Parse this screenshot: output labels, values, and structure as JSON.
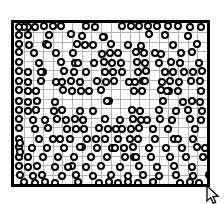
{
  "figure": {
    "title": "",
    "canvas": {
      "width": 224,
      "height": 204,
      "background": "#ffffff"
    },
    "frame": {
      "name": "plot-border",
      "x": 11,
      "y": 20,
      "width": 199,
      "height": 167,
      "border_width": 3,
      "border_color": "#000000",
      "fill": "#ffffff"
    },
    "grid": {
      "visible": true,
      "color": "#b4b4b4",
      "line_width": 1,
      "columns": 20,
      "rows": 17,
      "cell_width": 9.95,
      "cell_height": 9.82
    },
    "marker": {
      "shape": "ring",
      "diameter": 8,
      "ring_color": "#000000",
      "ring_width": 2.5,
      "fill_color": "#ffffff"
    },
    "cursor": {
      "name": "mouse-arrow-cursor",
      "x": 206,
      "y": 186,
      "color": "#000000",
      "label": "arrow-pointer"
    }
  },
  "chart_data": {
    "type": "scatter",
    "title": "",
    "xlabel": "",
    "ylabel": "",
    "xlim": [
      0,
      20
    ],
    "ylim": [
      0,
      17
    ],
    "grid": true,
    "legend": false,
    "marker_style": "open-circle",
    "point_count": 268,
    "points": [
      [
        1.4,
        0.45
      ],
      [
        3.1,
        0.3
      ],
      [
        4.0,
        0.35
      ],
      [
        4.9,
        0.35
      ],
      [
        8.4,
        0.4
      ],
      [
        11.2,
        0.3
      ],
      [
        12.1,
        0.3
      ],
      [
        13.0,
        0.35
      ],
      [
        13.9,
        0.3
      ],
      [
        14.8,
        0.35
      ],
      [
        17.0,
        0.35
      ],
      [
        19.4,
        0.4
      ],
      [
        20.4,
        0.35
      ],
      [
        21.3,
        0.4
      ],
      [
        0.5,
        1.3
      ],
      [
        1.5,
        1.25
      ],
      [
        5.9,
        1.2
      ],
      [
        7.0,
        1.35
      ],
      [
        9.3,
        1.45
      ],
      [
        14.0,
        1.2
      ],
      [
        15.6,
        1.3
      ],
      [
        18.0,
        1.4
      ],
      [
        20.6,
        1.35
      ],
      [
        0.5,
        2.2
      ],
      [
        1.6,
        2.3
      ],
      [
        3.3,
        2.2
      ],
      [
        6.5,
        2.25
      ],
      [
        8.2,
        2.3
      ],
      [
        10.0,
        2.25
      ],
      [
        13.2,
        2.4
      ],
      [
        16.5,
        2.3
      ],
      [
        19.0,
        2.2
      ],
      [
        20.5,
        2.35
      ],
      [
        0.5,
        3.1
      ],
      [
        2.1,
        3.2
      ],
      [
        4.4,
        3.15
      ],
      [
        6.1,
        3.2
      ],
      [
        9.1,
        3.3
      ],
      [
        9.9,
        3.2
      ],
      [
        10.8,
        3.15
      ],
      [
        12.6,
        3.1
      ],
      [
        13.5,
        3.2
      ],
      [
        15.2,
        3.25
      ],
      [
        17.3,
        3.2
      ],
      [
        18.4,
        3.1
      ],
      [
        20.4,
        3.2
      ],
      [
        0.5,
        4.1
      ],
      [
        2.6,
        4.2
      ],
      [
        4.9,
        4.15
      ],
      [
        6.3,
        4.2
      ],
      [
        9.3,
        4.15
      ],
      [
        10.2,
        4.25
      ],
      [
        11.1,
        4.2
      ],
      [
        12.7,
        4.1
      ],
      [
        13.6,
        4.2
      ],
      [
        15.0,
        4.2
      ],
      [
        16.3,
        4.15
      ],
      [
        17.2,
        4.25
      ],
      [
        19.2,
        4.2
      ],
      [
        20.4,
        4.15
      ],
      [
        0.5,
        5.1
      ],
      [
        1.5,
        5.2
      ],
      [
        3.0,
        5.15
      ],
      [
        5.2,
        5.1
      ],
      [
        6.2,
        5.2
      ],
      [
        9.4,
        5.15
      ],
      [
        10.3,
        5.2
      ],
      [
        11.2,
        5.15
      ],
      [
        12.8,
        5.2
      ],
      [
        13.7,
        5.1
      ],
      [
        15.6,
        5.2
      ],
      [
        16.5,
        5.15
      ],
      [
        18.6,
        5.2
      ],
      [
        19.5,
        5.1
      ],
      [
        20.5,
        5.2
      ],
      [
        0.5,
        6.1
      ],
      [
        1.4,
        6.2
      ],
      [
        2.8,
        6.15
      ],
      [
        5.0,
        6.2
      ],
      [
        5.9,
        6.1
      ],
      [
        6.8,
        6.2
      ],
      [
        8.6,
        6.15
      ],
      [
        9.5,
        6.2
      ],
      [
        10.4,
        6.1
      ],
      [
        12.5,
        6.2
      ],
      [
        13.4,
        6.15
      ],
      [
        15.3,
        6.2
      ],
      [
        16.2,
        6.1
      ],
      [
        17.1,
        6.2
      ],
      [
        19.3,
        6.15
      ],
      [
        20.4,
        6.2
      ],
      [
        0.5,
        7.1
      ],
      [
        1.4,
        7.2
      ],
      [
        2.3,
        7.15
      ],
      [
        5.1,
        7.1
      ],
      [
        6.0,
        7.2
      ],
      [
        6.9,
        7.15
      ],
      [
        7.8,
        7.2
      ],
      [
        9.0,
        7.1
      ],
      [
        12.4,
        7.2
      ],
      [
        13.3,
        7.15
      ],
      [
        15.2,
        7.1
      ],
      [
        16.1,
        7.2
      ],
      [
        17.0,
        7.15
      ],
      [
        19.4,
        7.2
      ],
      [
        20.5,
        7.1
      ],
      [
        0.5,
        8.2
      ],
      [
        1.5,
        8.3
      ],
      [
        2.4,
        8.2
      ],
      [
        4.2,
        8.3
      ],
      [
        9.8,
        8.25
      ],
      [
        15.4,
        8.2
      ],
      [
        17.5,
        8.3
      ],
      [
        18.4,
        8.2
      ],
      [
        19.3,
        8.3
      ],
      [
        20.4,
        8.25
      ],
      [
        0.5,
        9.2
      ],
      [
        1.4,
        9.3
      ],
      [
        2.3,
        9.2
      ],
      [
        4.1,
        9.3
      ],
      [
        5.0,
        9.2
      ],
      [
        6.8,
        9.3
      ],
      [
        12.2,
        9.2
      ],
      [
        13.1,
        9.3
      ],
      [
        15.0,
        9.2
      ],
      [
        16.8,
        9.3
      ],
      [
        18.0,
        9.2
      ],
      [
        19.5,
        9.3
      ],
      [
        20.4,
        9.2
      ],
      [
        0.5,
        10.1
      ],
      [
        2.0,
        10.2
      ],
      [
        4.5,
        10.15
      ],
      [
        5.4,
        10.2
      ],
      [
        6.3,
        10.1
      ],
      [
        7.2,
        10.2
      ],
      [
        9.4,
        10.15
      ],
      [
        11.0,
        10.2
      ],
      [
        12.3,
        10.1
      ],
      [
        13.2,
        10.2
      ],
      [
        15.1,
        10.15
      ],
      [
        16.4,
        10.2
      ],
      [
        18.2,
        10.1
      ],
      [
        19.4,
        10.2
      ],
      [
        20.5,
        10.15
      ],
      [
        0.5,
        11.1
      ],
      [
        2.2,
        11.2
      ],
      [
        3.5,
        11.1
      ],
      [
        5.5,
        11.2
      ],
      [
        6.4,
        11.15
      ],
      [
        7.3,
        11.2
      ],
      [
        8.8,
        11.1
      ],
      [
        9.7,
        11.2
      ],
      [
        11.2,
        11.15
      ],
      [
        12.1,
        11.2
      ],
      [
        13.0,
        11.1
      ],
      [
        14.4,
        11.2
      ],
      [
        16.0,
        11.15
      ],
      [
        18.8,
        11.2
      ],
      [
        20.4,
        11.1
      ],
      [
        0.5,
        12.2
      ],
      [
        2.6,
        12.3
      ],
      [
        4.0,
        12.2
      ],
      [
        5.8,
        12.3
      ],
      [
        7.6,
        12.2
      ],
      [
        8.5,
        12.3
      ],
      [
        9.4,
        12.2
      ],
      [
        10.8,
        12.3
      ],
      [
        12.0,
        12.2
      ],
      [
        12.9,
        12.3
      ],
      [
        14.6,
        12.2
      ],
      [
        16.6,
        12.3
      ],
      [
        18.5,
        12.2
      ],
      [
        20.4,
        12.3
      ],
      [
        0.5,
        13.1
      ],
      [
        1.9,
        13.2
      ],
      [
        3.4,
        13.15
      ],
      [
        5.2,
        13.2
      ],
      [
        7.0,
        13.1
      ],
      [
        8.6,
        13.2
      ],
      [
        10.2,
        13.15
      ],
      [
        11.4,
        13.2
      ],
      [
        12.3,
        13.1
      ],
      [
        14.0,
        13.2
      ],
      [
        15.8,
        13.15
      ],
      [
        17.4,
        13.2
      ],
      [
        19.0,
        13.1
      ],
      [
        20.4,
        13.2
      ],
      [
        0.5,
        14.1
      ],
      [
        1.5,
        14.2
      ],
      [
        3.0,
        14.15
      ],
      [
        4.6,
        14.2
      ],
      [
        6.2,
        14.1
      ],
      [
        8.0,
        14.2
      ],
      [
        9.6,
        14.15
      ],
      [
        11.5,
        14.2
      ],
      [
        12.4,
        14.1
      ],
      [
        14.2,
        14.2
      ],
      [
        16.2,
        14.15
      ],
      [
        17.8,
        14.2
      ],
      [
        19.6,
        14.1
      ],
      [
        20.4,
        14.2
      ],
      [
        0.5,
        15.1
      ],
      [
        1.4,
        15.2
      ],
      [
        2.4,
        15.15
      ],
      [
        4.2,
        15.2
      ],
      [
        6.0,
        15.1
      ],
      [
        7.5,
        15.2
      ],
      [
        9.0,
        15.15
      ],
      [
        11.0,
        15.2
      ],
      [
        13.0,
        15.1
      ],
      [
        14.8,
        15.2
      ],
      [
        16.6,
        15.15
      ],
      [
        18.4,
        15.2
      ],
      [
        20.4,
        15.1
      ],
      [
        20.5,
        15.6
      ],
      [
        0.6,
        16.1
      ],
      [
        2.0,
        16.15
      ],
      [
        2.9,
        16.1
      ],
      [
        5.0,
        16.15
      ],
      [
        6.4,
        16.1
      ],
      [
        8.2,
        16.15
      ],
      [
        10.0,
        16.1
      ],
      [
        11.8,
        16.15
      ],
      [
        13.4,
        16.1
      ],
      [
        15.0,
        16.15
      ],
      [
        16.8,
        16.1
      ],
      [
        18.6,
        16.15
      ],
      [
        20.2,
        16.1
      ],
      [
        1.0,
        16.8
      ],
      [
        2.2,
        16.85
      ],
      [
        3.2,
        16.8
      ],
      [
        4.2,
        16.85
      ],
      [
        6.6,
        16.8
      ],
      [
        8.8,
        16.85
      ],
      [
        9.8,
        16.8
      ],
      [
        10.8,
        16.85
      ],
      [
        11.8,
        16.8
      ],
      [
        12.8,
        16.85
      ],
      [
        14.4,
        16.8
      ],
      [
        17.2,
        16.85
      ],
      [
        18.2,
        16.8
      ],
      [
        19.2,
        16.85
      ],
      [
        9.6,
        8.25
      ],
      [
        3.6,
        1.3
      ],
      [
        3.5,
        2.3
      ],
      [
        7.4,
        2.3
      ],
      [
        8.3,
        4.2
      ],
      [
        11.8,
        2.3
      ],
      [
        14.6,
        3.2
      ],
      [
        17.6,
        5.2
      ],
      [
        18.3,
        6.15
      ],
      [
        10.6,
        11.15
      ],
      [
        4.8,
        12.2
      ],
      [
        13.8,
        10.2
      ],
      [
        6.6,
        4.2
      ],
      [
        7.5,
        5.15
      ],
      [
        11.9,
        6.2
      ],
      [
        15.9,
        7.15
      ],
      [
        3.2,
        10.2
      ],
      [
        8.2,
        9.3
      ],
      [
        5.6,
        15.2
      ],
      [
        12.6,
        14.2
      ],
      [
        17.0,
        12.3
      ],
      [
        19.8,
        13.2
      ],
      [
        2.8,
        5.15
      ],
      [
        10.5,
        13.15
      ],
      [
        6.8,
        13.1
      ],
      [
        13.6,
        6.15
      ],
      [
        9.2,
        1.45
      ],
      [
        4.4,
        6.2
      ],
      [
        1.0,
        0.45
      ],
      [
        2.2,
        0.4
      ],
      [
        7.5,
        0.35
      ],
      [
        16.0,
        0.35
      ],
      [
        18.2,
        0.4
      ],
      [
        0.5,
        0.45
      ],
      [
        20.5,
        16.8
      ],
      [
        0.6,
        12.7
      ],
      [
        0.6,
        13.6
      ]
    ]
  }
}
